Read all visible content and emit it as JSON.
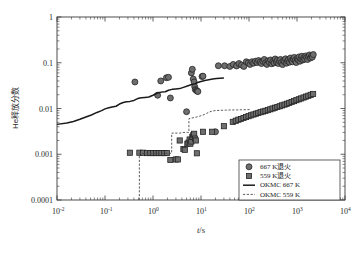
{
  "chart_data": {
    "type": "scatter",
    "title": "",
    "xlabel": "t/s",
    "ylabel": "He释放分数",
    "xscale": "log",
    "yscale": "log",
    "xlim": [
      0.01,
      10000
    ],
    "ylim": [
      0.0001,
      1
    ],
    "grid": false,
    "legend_position": "bottom-right",
    "x_tick_labels": [
      "10⁻²",
      "10⁻¹",
      "10⁰",
      "10¹",
      "10²",
      "10³",
      "10⁴"
    ],
    "x_tick_values": [
      0.01,
      0.1,
      1,
      10,
      100,
      1000,
      10000
    ],
    "y_tick_labels": [
      "0.0001",
      "0.001",
      "0.01",
      "0.1",
      "1"
    ],
    "y_tick_values": [
      0.0001,
      0.001,
      0.01,
      0.1,
      1
    ],
    "series": [
      {
        "name": "667 K退火",
        "marker": "circle",
        "color": "#6e6e6e",
        "points": [
          [
            0.42,
            0.038
          ],
          [
            1.25,
            0.0195
          ],
          [
            1.45,
            0.04
          ],
          [
            1.9,
            0.047
          ],
          [
            2.1,
            0.048
          ],
          [
            2.3,
            0.017
          ],
          [
            5.0,
            0.0085
          ],
          [
            6.3,
            0.06
          ],
          [
            6.6,
            0.072
          ],
          [
            6.9,
            0.044
          ],
          [
            7.2,
            0.038
          ],
          [
            7.4,
            0.03
          ],
          [
            7.6,
            0.026
          ],
          [
            8.0,
            0.025
          ],
          [
            8.3,
            0.024
          ],
          [
            8.6,
            0.0235
          ],
          [
            10.5,
            0.05
          ],
          [
            11.0,
            0.051
          ],
          [
            20.0,
            0.0031
          ],
          [
            23.0,
            0.086
          ],
          [
            31.0,
            0.086
          ],
          [
            40.0,
            0.083
          ],
          [
            47.0,
            0.092
          ],
          [
            55.0,
            0.085
          ],
          [
            62.0,
            0.096
          ],
          [
            70.0,
            0.089
          ],
          [
            78.0,
            0.083
          ],
          [
            88.0,
            0.105
          ],
          [
            96.0,
            0.099
          ],
          [
            105.0,
            0.092
          ],
          [
            115.0,
            0.105
          ],
          [
            125.0,
            0.098
          ],
          [
            136.0,
            0.108
          ],
          [
            147.0,
            0.101
          ],
          [
            158.0,
            0.112
          ],
          [
            170.0,
            0.103
          ],
          [
            182.0,
            0.096
          ],
          [
            195.0,
            0.108
          ],
          [
            208.0,
            0.118
          ],
          [
            222.0,
            0.1
          ],
          [
            236.0,
            0.092
          ],
          [
            251.0,
            0.11
          ],
          [
            266.0,
            0.102
          ],
          [
            282.0,
            0.115
          ],
          [
            298.0,
            0.095
          ],
          [
            315.0,
            0.107
          ],
          [
            333.0,
            0.099
          ],
          [
            351.0,
            0.121
          ],
          [
            370.0,
            0.104
          ],
          [
            390.0,
            0.113
          ],
          [
            410.0,
            0.096
          ],
          [
            431.0,
            0.108
          ],
          [
            453.0,
            0.118
          ],
          [
            476.0,
            0.102
          ],
          [
            500.0,
            0.091
          ],
          [
            525.0,
            0.112
          ],
          [
            551.0,
            0.105
          ],
          [
            578.0,
            0.122
          ],
          [
            606.0,
            0.098
          ],
          [
            635.0,
            0.11
          ],
          [
            666.0,
            0.118
          ],
          [
            698.0,
            0.103
          ],
          [
            731.0,
            0.127
          ],
          [
            766.0,
            0.112
          ],
          [
            802.0,
            0.105
          ],
          [
            840.0,
            0.12
          ],
          [
            879.0,
            0.131
          ],
          [
            920.0,
            0.113
          ],
          [
            963.0,
            0.101
          ],
          [
            1008.0,
            0.124
          ],
          [
            1055.0,
            0.116
          ],
          [
            1104.0,
            0.134
          ],
          [
            1155.0,
            0.108
          ],
          [
            1209.0,
            0.122
          ],
          [
            1265.0,
            0.139
          ],
          [
            1324.0,
            0.115
          ],
          [
            1385.0,
            0.128
          ],
          [
            1450.0,
            0.12
          ],
          [
            1517.0,
            0.141
          ],
          [
            1588.0,
            0.13
          ],
          [
            1662.0,
            0.118
          ],
          [
            1739.0,
            0.136
          ],
          [
            1820.0,
            0.148
          ],
          [
            1905.0,
            0.127
          ],
          [
            1994.0,
            0.14
          ],
          [
            2087.0,
            0.133
          ],
          [
            2185.0,
            0.151
          ]
        ]
      },
      {
        "name": "559 K退火",
        "marker": "square",
        "color": "#6e6e6e",
        "points": [
          [
            0.33,
            0.00108
          ],
          [
            0.52,
            0.00108
          ],
          [
            0.62,
            0.00108
          ],
          [
            0.75,
            0.00106
          ],
          [
            0.88,
            0.00106
          ],
          [
            1.0,
            0.00106
          ],
          [
            1.15,
            0.00106
          ],
          [
            1.32,
            0.00106
          ],
          [
            1.5,
            0.00106
          ],
          [
            1.72,
            0.00106
          ],
          [
            1.95,
            0.00106
          ],
          [
            2.3,
            0.00075
          ],
          [
            3.0,
            0.00077
          ],
          [
            3.3,
            0.00077
          ],
          [
            3.6,
            0.002
          ],
          [
            4.3,
            0.0013
          ],
          [
            4.6,
            0.00125
          ],
          [
            5.2,
            0.0017
          ],
          [
            5.5,
            0.0018
          ],
          [
            5.8,
            0.0021
          ],
          [
            6.0,
            0.0017
          ],
          [
            6.3,
            0.0019
          ],
          [
            6.6,
            0.0024
          ],
          [
            6.9,
            0.0026
          ],
          [
            7.2,
            0.0028
          ],
          [
            7.5,
            0.0022
          ],
          [
            7.8,
            0.002
          ],
          [
            8.2,
            0.00105
          ],
          [
            11.0,
            0.0031
          ],
          [
            17.0,
            0.0031
          ],
          [
            30.0,
            0.0041
          ],
          [
            46.0,
            0.0051
          ],
          [
            53.0,
            0.0054
          ],
          [
            60.0,
            0.0057
          ],
          [
            68.0,
            0.0059
          ],
          [
            77.0,
            0.0062
          ],
          [
            87.0,
            0.0065
          ],
          [
            98.0,
            0.0068
          ],
          [
            110.0,
            0.0071
          ],
          [
            124.0,
            0.0074
          ],
          [
            139.0,
            0.0077
          ],
          [
            156.0,
            0.008
          ],
          [
            175.0,
            0.0083
          ],
          [
            196.0,
            0.0086
          ],
          [
            220.0,
            0.0089
          ],
          [
            247.0,
            0.0092
          ],
          [
            277.0,
            0.0096
          ],
          [
            310.0,
            0.01
          ],
          [
            348.0,
            0.0104
          ],
          [
            390.0,
            0.0108
          ],
          [
            437.0,
            0.0112
          ],
          [
            490.0,
            0.0117
          ],
          [
            550.0,
            0.0122
          ],
          [
            616.0,
            0.0127
          ],
          [
            690.0,
            0.0133
          ],
          [
            774.0,
            0.0139
          ],
          [
            868.0,
            0.0145
          ],
          [
            973.0,
            0.0152
          ],
          [
            1091.0,
            0.0159
          ],
          [
            1223.0,
            0.0166
          ],
          [
            1371.0,
            0.0174
          ],
          [
            1537.0,
            0.0182
          ],
          [
            1723.0,
            0.019
          ],
          [
            1932.0,
            0.0199
          ],
          [
            2166.0,
            0.0208
          ]
        ]
      },
      {
        "name": "OKMC 667 K",
        "marker": "line-solid",
        "color": "#1a1a1a",
        "points": [
          [
            0.01,
            0.0045
          ],
          [
            0.016,
            0.0048
          ],
          [
            0.022,
            0.0052
          ],
          [
            0.03,
            0.0058
          ],
          [
            0.04,
            0.0065
          ],
          [
            0.052,
            0.0072
          ],
          [
            0.068,
            0.0082
          ],
          [
            0.085,
            0.009
          ],
          [
            0.1,
            0.0098
          ],
          [
            0.12,
            0.0104
          ],
          [
            0.14,
            0.0108
          ],
          [
            0.17,
            0.0112
          ],
          [
            0.2,
            0.0125
          ],
          [
            0.24,
            0.0135
          ],
          [
            0.28,
            0.014
          ],
          [
            0.33,
            0.0143
          ],
          [
            0.4,
            0.015
          ],
          [
            0.48,
            0.0165
          ],
          [
            0.57,
            0.0172
          ],
          [
            0.68,
            0.0175
          ],
          [
            0.82,
            0.0178
          ],
          [
            1.0,
            0.0195
          ],
          [
            1.2,
            0.0215
          ],
          [
            1.35,
            0.0225
          ],
          [
            1.5,
            0.0228
          ],
          [
            1.8,
            0.0232
          ],
          [
            2.1,
            0.025
          ],
          [
            2.5,
            0.0262
          ],
          [
            3.0,
            0.0268
          ],
          [
            3.6,
            0.0272
          ],
          [
            4.3,
            0.029
          ],
          [
            5.2,
            0.031
          ],
          [
            6.2,
            0.033
          ],
          [
            7.4,
            0.0345
          ],
          [
            8.5,
            0.037
          ],
          [
            10.0,
            0.039
          ],
          [
            12.0,
            0.041
          ],
          [
            14.5,
            0.0425
          ],
          [
            17.5,
            0.044
          ],
          [
            21.0,
            0.045
          ],
          [
            25.0,
            0.0458
          ],
          [
            30.0,
            0.0462
          ]
        ]
      },
      {
        "name": "OKMC 559 K",
        "marker": "line-dashed",
        "color": "#4a4a4a",
        "points": [
          [
            0.52,
            0.0001
          ],
          [
            0.52,
            0.00104
          ],
          [
            0.65,
            0.00104
          ],
          [
            0.85,
            0.00104
          ],
          [
            1.1,
            0.00104
          ],
          [
            1.4,
            0.00104
          ],
          [
            1.8,
            0.00105
          ],
          [
            2.2,
            0.00105
          ],
          [
            2.45,
            0.00105
          ],
          [
            2.45,
            0.0029
          ],
          [
            3.0,
            0.0029
          ],
          [
            3.6,
            0.0029
          ],
          [
            4.4,
            0.003
          ],
          [
            5.2,
            0.003
          ],
          [
            5.6,
            0.003
          ],
          [
            5.6,
            0.006
          ],
          [
            6.5,
            0.0062
          ],
          [
            7.5,
            0.0064
          ],
          [
            9.0,
            0.0067
          ],
          [
            11.0,
            0.0072
          ],
          [
            13.0,
            0.0078
          ],
          [
            15.0,
            0.0084
          ],
          [
            17.0,
            0.0088
          ],
          [
            20.0,
            0.009
          ],
          [
            25.0,
            0.0091
          ],
          [
            32.0,
            0.0092
          ],
          [
            42.0,
            0.0093
          ],
          [
            55.0,
            0.0093
          ],
          [
            70.0,
            0.0094
          ],
          [
            90.0,
            0.0094
          ],
          [
            110.0,
            0.0095
          ]
        ]
      }
    ]
  },
  "axes": {
    "x_title": "t/s",
    "y_title": "He释放分数",
    "x_ticks": [
      {
        "base": "10",
        "exp": "-2"
      },
      {
        "base": "10",
        "exp": "-1"
      },
      {
        "base": "10",
        "exp": "0"
      },
      {
        "base": "10",
        "exp": "1"
      },
      {
        "base": "10",
        "exp": "2"
      },
      {
        "base": "10",
        "exp": "3"
      },
      {
        "base": "10",
        "exp": "4"
      }
    ],
    "y_ticks": [
      "1",
      "0.1",
      "0.01",
      "0.001",
      "0.0001"
    ]
  },
  "legend": {
    "items": [
      {
        "label": "667 K退火",
        "kind": "circle"
      },
      {
        "label": "559 K退火",
        "kind": "square"
      },
      {
        "label": "OKMC 667 K",
        "kind": "line-solid"
      },
      {
        "label": "OKMC 559 K",
        "kind": "line-dashed"
      }
    ]
  }
}
